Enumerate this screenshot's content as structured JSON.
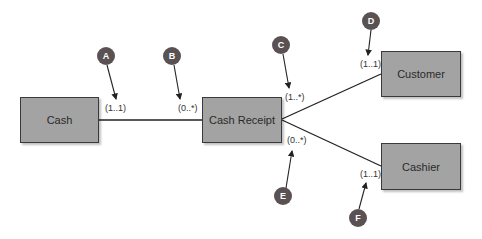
{
  "diagram": {
    "type": "UML class diagram (REA)",
    "classes": [
      {
        "id": "cash",
        "label": "Cash"
      },
      {
        "id": "cash_receipt",
        "label": "Cash Receipt"
      },
      {
        "id": "customer",
        "label": "Customer"
      },
      {
        "id": "cashier",
        "label": "Cashier"
      }
    ],
    "associations": [
      {
        "from": "cash",
        "to": "cash_receipt",
        "from_mult": "(1..1)",
        "to_mult": "(0..*)"
      },
      {
        "from": "cash_receipt",
        "to": "customer",
        "from_mult": "(1..*)",
        "to_mult": "(1..1)"
      },
      {
        "from": "cash_receipt",
        "to": "cashier",
        "from_mult": "(0..*)",
        "to_mult": "(1..1)"
      }
    ],
    "multiplicities": {
      "a": "(1..1)",
      "b": "(0..*)",
      "c": "(1..*)",
      "d": "(1..1)",
      "e": "(0..*)",
      "f": "(1..1)"
    },
    "callouts": {
      "a": "A",
      "b": "B",
      "c": "C",
      "d": "D",
      "e": "E",
      "f": "F"
    },
    "colors": {
      "box_fill": "#a3a3a3",
      "box_border": "#3a3a3a",
      "callout_fill": "#5a5152",
      "line": "#222222"
    }
  }
}
